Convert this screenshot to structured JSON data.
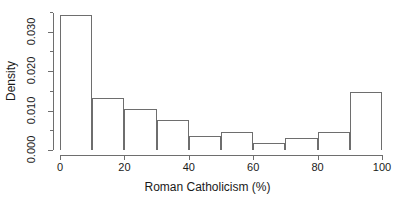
{
  "chart_data": {
    "type": "bar",
    "title": "",
    "subtitle": "",
    "xlabel": "Roman Catholicism (%)",
    "ylabel": "Density",
    "xlim": [
      0,
      100
    ],
    "ylim": [
      0,
      0.0355
    ],
    "grid": false,
    "legend": null,
    "bin_width": 10,
    "bin_edges": [
      0,
      10,
      20,
      30,
      40,
      50,
      60,
      70,
      80,
      90,
      100
    ],
    "categories": [
      "0-10",
      "10-20",
      "20-30",
      "30-40",
      "40-50",
      "50-60",
      "60-70",
      "70-80",
      "80-90",
      "90-100"
    ],
    "values": [
      0.0343,
      0.0133,
      0.0105,
      0.0077,
      0.0035,
      0.0045,
      0.0018,
      0.003,
      0.0045,
      0.0148
    ],
    "xticks": [
      0,
      20,
      40,
      60,
      80,
      100
    ],
    "xtick_labels": [
      "0",
      "20",
      "40",
      "60",
      "80",
      "100"
    ],
    "yticks": [
      0.0,
      0.01,
      0.02,
      0.03
    ],
    "ytick_labels": [
      "0.000",
      "0.010",
      "0.020",
      "0.030"
    ],
    "yticks_minor": [
      0.005,
      0.015,
      0.025,
      0.035
    ],
    "bar_edge_color": "#6e6e6e",
    "bar_fill_color": "transparent",
    "axis_color": "#6e6e6e",
    "text_color": "#1a1a1a",
    "background_color": "#ffffff"
  }
}
